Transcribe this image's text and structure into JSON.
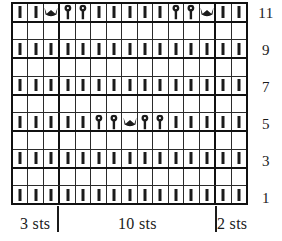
{
  "chart": {
    "type": "knitting-chart",
    "title": "",
    "columns": 15,
    "rows": 11,
    "row_labels": [
      "11",
      "9",
      "7",
      "5",
      "3",
      "1"
    ],
    "symbol_legend": {
      "knit": "vertical-bar-stitch",
      "bobble": "bobble-stitch",
      "crown": "crown-stitch",
      "empty": "no-stitch"
    },
    "grid": [
      {
        "row": 11,
        "cells": [
          "knit",
          "knit",
          "crown",
          "bobble",
          "bobble",
          "knit",
          "knit",
          "knit",
          "knit",
          "knit",
          "bobble",
          "bobble",
          "crown",
          "knit",
          "knit"
        ]
      },
      {
        "row": 10,
        "cells": [
          "empty",
          "empty",
          "empty",
          "empty",
          "empty",
          "empty",
          "empty",
          "empty",
          "empty",
          "empty",
          "empty",
          "empty",
          "empty",
          "empty",
          "empty"
        ]
      },
      {
        "row": 9,
        "cells": [
          "knit",
          "knit",
          "knit",
          "knit",
          "knit",
          "knit",
          "knit",
          "knit",
          "knit",
          "knit",
          "knit",
          "knit",
          "knit",
          "knit",
          "knit"
        ]
      },
      {
        "row": 8,
        "cells": [
          "empty",
          "empty",
          "empty",
          "empty",
          "empty",
          "empty",
          "empty",
          "empty",
          "empty",
          "empty",
          "empty",
          "empty",
          "empty",
          "empty",
          "empty"
        ]
      },
      {
        "row": 7,
        "cells": [
          "knit",
          "knit",
          "knit",
          "knit",
          "knit",
          "knit",
          "knit",
          "knit",
          "knit",
          "knit",
          "knit",
          "knit",
          "knit",
          "knit",
          "knit"
        ]
      },
      {
        "row": 6,
        "cells": [
          "empty",
          "empty",
          "empty",
          "empty",
          "empty",
          "empty",
          "empty",
          "empty",
          "empty",
          "empty",
          "empty",
          "empty",
          "empty",
          "empty",
          "empty"
        ]
      },
      {
        "row": 5,
        "cells": [
          "knit",
          "knit",
          "knit",
          "knit",
          "knit",
          "bobble",
          "bobble",
          "crown",
          "bobble",
          "bobble",
          "knit",
          "knit",
          "knit",
          "knit",
          "knit"
        ]
      },
      {
        "row": 4,
        "cells": [
          "empty",
          "empty",
          "empty",
          "empty",
          "empty",
          "empty",
          "empty",
          "empty",
          "empty",
          "empty",
          "empty",
          "empty",
          "empty",
          "empty",
          "empty"
        ]
      },
      {
        "row": 3,
        "cells": [
          "knit",
          "knit",
          "knit",
          "knit",
          "knit",
          "knit",
          "knit",
          "knit",
          "knit",
          "knit",
          "knit",
          "knit",
          "knit",
          "knit",
          "knit"
        ]
      },
      {
        "row": 2,
        "cells": [
          "empty",
          "empty",
          "empty",
          "empty",
          "empty",
          "empty",
          "empty",
          "empty",
          "empty",
          "empty",
          "empty",
          "empty",
          "empty",
          "empty",
          "empty"
        ]
      },
      {
        "row": 1,
        "cells": [
          "knit",
          "knit",
          "knit",
          "knit",
          "knit",
          "knit",
          "knit",
          "knit",
          "knit",
          "knit",
          "knit",
          "knit",
          "knit",
          "knit",
          "knit"
        ]
      }
    ],
    "axis": {
      "segments": [
        {
          "label": "3 sts",
          "stitches": 3
        },
        {
          "label": "10 sts",
          "stitches": 10
        },
        {
          "label": "2 sts",
          "stitches": 2
        }
      ],
      "tick_after_columns": [
        3,
        13
      ]
    },
    "colors": {
      "ink": "#1b1b1b",
      "gridline": "#2b2b2b",
      "border": "#111111",
      "background": "#ffffff"
    }
  }
}
